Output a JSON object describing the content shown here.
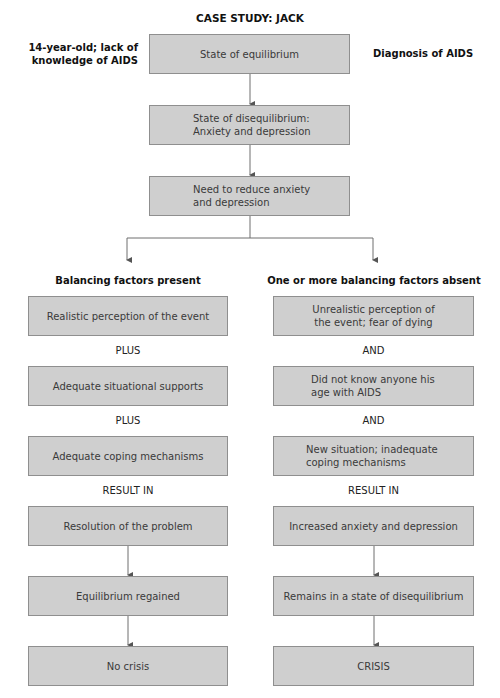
{
  "title": "CASE STUDY:  JACK",
  "side_labels": {
    "left": "14-year-old; lack of knowledge of AIDS",
    "left_line1": "14-year-old; lack of",
    "left_line2": "knowledge of AIDS",
    "right": "Diagnosis of AIDS"
  },
  "center_flow": [
    {
      "line1": "State of equilibrium",
      "line2": ""
    },
    {
      "line1": "State of disequilibrium:",
      "line2": "Anxiety and depression"
    },
    {
      "line1": "Need to reduce anxiety",
      "line2": "and depression"
    }
  ],
  "left_branch": {
    "header": "Balancing factors present",
    "boxes": [
      {
        "line1": "Realistic perception of the event",
        "line2": ""
      },
      {
        "line1": "Adequate situational supports",
        "line2": ""
      },
      {
        "line1": "Adequate coping mechanisms",
        "line2": ""
      },
      {
        "line1": "Resolution of the problem",
        "line2": ""
      },
      {
        "line1": "Equilibrium regained",
        "line2": ""
      },
      {
        "line1": "No crisis",
        "line2": ""
      }
    ],
    "connectors": [
      "PLUS",
      "PLUS",
      "RESULT IN"
    ]
  },
  "right_branch": {
    "header": "One or more balancing factors absent",
    "boxes": [
      {
        "line1": "Unrealistic perception of",
        "line2": "the event; fear of dying"
      },
      {
        "line1": "Did not know anyone his",
        "line2": "age with AIDS"
      },
      {
        "line1": "New situation; inadequate",
        "line2": "coping mechanisms"
      },
      {
        "line1": "Increased anxiety and depression",
        "line2": ""
      },
      {
        "line1": "Remains in a state of disequilibrium",
        "line2": ""
      },
      {
        "line1": "CRISIS",
        "line2": ""
      }
    ],
    "connectors": [
      "AND",
      "AND",
      "RESULT IN"
    ]
  },
  "colors": {
    "box_fill": "#cfcfcf",
    "box_border": "#8f8f8f",
    "line": "#6e6e6e",
    "text": "#3a3a3a"
  }
}
